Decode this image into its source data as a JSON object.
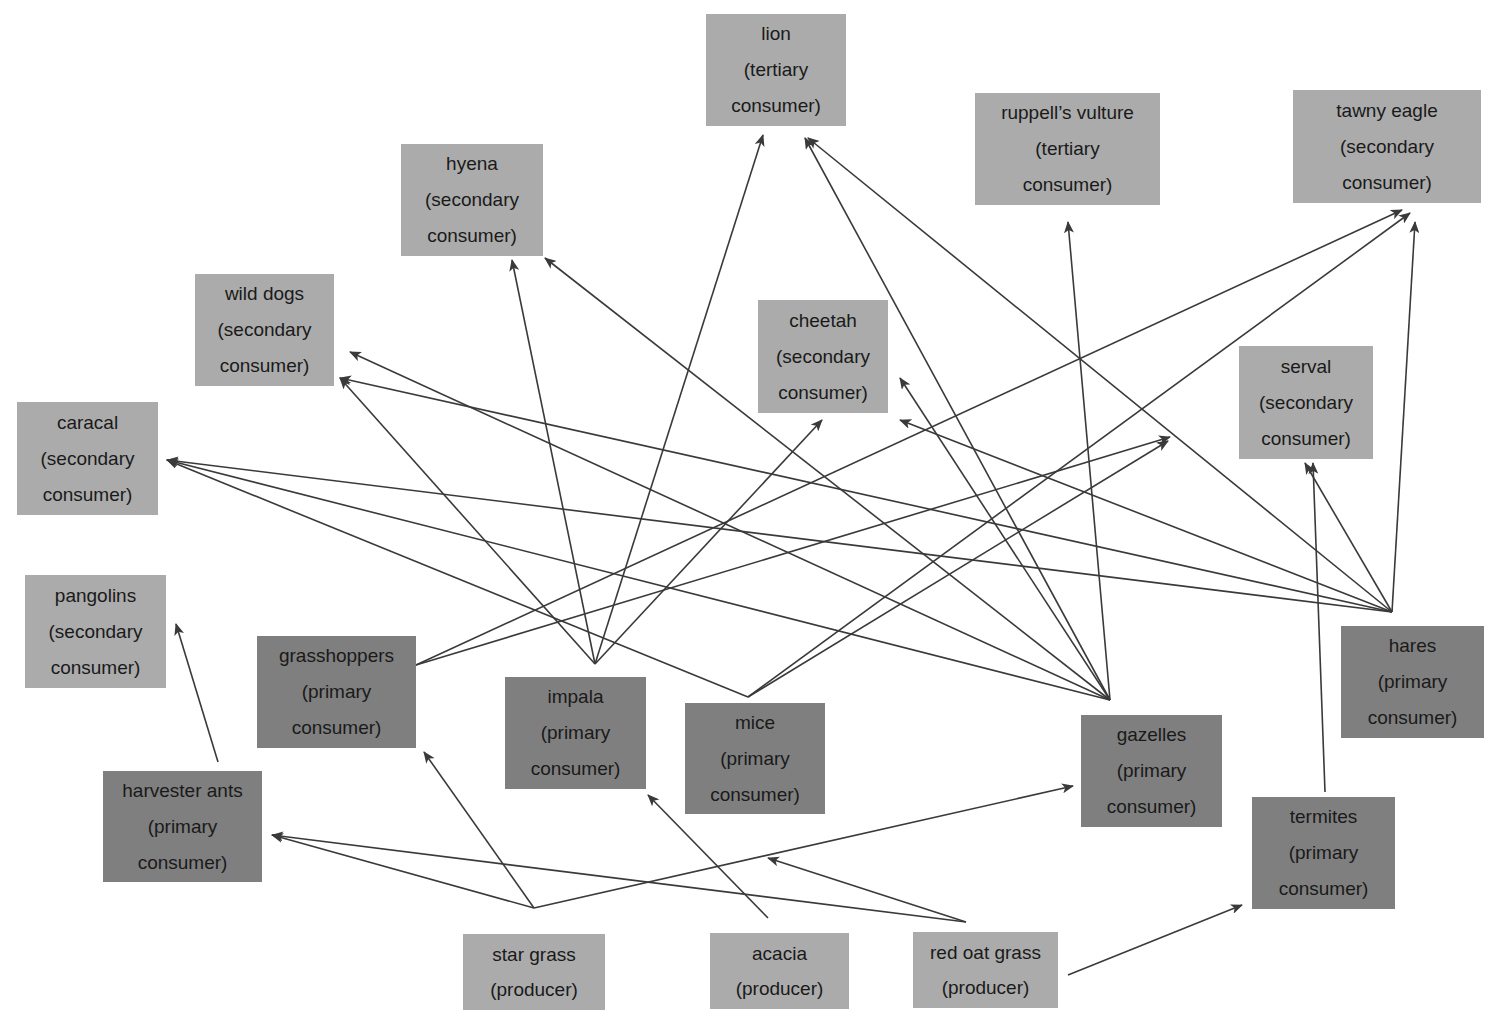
{
  "diagram": {
    "type": "food web",
    "colors": {
      "higher_level_box": "#ababab",
      "primary_consumer_box": "#7f7f7f",
      "producer_box": "#ababab",
      "arrow": "#3a3a3a",
      "text": "#1a1a1a"
    },
    "nodes": [
      {
        "id": "lion",
        "name": "lion",
        "role": "(tertiary",
        "role2": "consumer)",
        "x": 706,
        "y": 14,
        "w": 140,
        "h": 112,
        "tone": "light"
      },
      {
        "id": "hyena",
        "name": "hyena",
        "role": "(secondary",
        "role2": "consumer)",
        "x": 401,
        "y": 144,
        "w": 142,
        "h": 112,
        "tone": "light"
      },
      {
        "id": "ruppells_vulture",
        "name": "ruppell’s vulture",
        "role": "(tertiary",
        "role2": "consumer)",
        "x": 975,
        "y": 93,
        "w": 185,
        "h": 112,
        "tone": "light"
      },
      {
        "id": "tawny_eagle",
        "name": "tawny eagle",
        "role": "(secondary",
        "role2": "consumer)",
        "x": 1293,
        "y": 90,
        "w": 188,
        "h": 113,
        "tone": "light"
      },
      {
        "id": "wild_dogs",
        "name": "wild dogs",
        "role": "(secondary",
        "role2": "consumer)",
        "x": 195,
        "y": 274,
        "w": 139,
        "h": 112,
        "tone": "light"
      },
      {
        "id": "cheetah",
        "name": "cheetah",
        "role": "(secondary",
        "role2": "consumer)",
        "x": 758,
        "y": 300,
        "w": 130,
        "h": 113,
        "tone": "light"
      },
      {
        "id": "caracal",
        "name": "caracal",
        "role": "(secondary",
        "role2": "consumer)",
        "x": 17,
        "y": 402,
        "w": 141,
        "h": 113,
        "tone": "light"
      },
      {
        "id": "serval",
        "name": "serval",
        "role": "(secondary",
        "role2": "consumer)",
        "x": 1239,
        "y": 346,
        "w": 134,
        "h": 113,
        "tone": "light"
      },
      {
        "id": "pangolins",
        "name": "pangolins",
        "role": "(secondary",
        "role2": "consumer)",
        "x": 25,
        "y": 575,
        "w": 141,
        "h": 113,
        "tone": "light"
      },
      {
        "id": "grasshoppers",
        "name": "grasshoppers",
        "role": "(primary",
        "role2": "consumer)",
        "x": 257,
        "y": 636,
        "w": 159,
        "h": 112,
        "tone": "dark"
      },
      {
        "id": "impala",
        "name": "impala",
        "role": "(primary",
        "role2": "consumer)",
        "x": 505,
        "y": 677,
        "w": 141,
        "h": 112,
        "tone": "dark"
      },
      {
        "id": "mice",
        "name": "mice",
        "role": "(primary",
        "role2": "consumer)",
        "x": 685,
        "y": 703,
        "w": 140,
        "h": 111,
        "tone": "dark"
      },
      {
        "id": "hares",
        "name": "hares",
        "role": "(primary",
        "role2": "consumer)",
        "x": 1341,
        "y": 626,
        "w": 143,
        "h": 112,
        "tone": "dark"
      },
      {
        "id": "gazelles",
        "name": "gazelles",
        "role": "(primary",
        "role2": "consumer)",
        "x": 1081,
        "y": 715,
        "w": 141,
        "h": 112,
        "tone": "dark"
      },
      {
        "id": "harvester_ants",
        "name": "harvester ants",
        "role": "(primary",
        "role2": "consumer)",
        "x": 103,
        "y": 771,
        "w": 159,
        "h": 111,
        "tone": "dark"
      },
      {
        "id": "termites",
        "name": "termites",
        "role": "(primary",
        "role2": "consumer)",
        "x": 1252,
        "y": 797,
        "w": 143,
        "h": 112,
        "tone": "dark"
      },
      {
        "id": "star_grass",
        "name": "star grass",
        "role": "(producer)",
        "role2": "",
        "x": 463,
        "y": 934,
        "w": 142,
        "h": 76,
        "tone": "light"
      },
      {
        "id": "acacia",
        "name": "acacia",
        "role": "(producer)",
        "role2": "",
        "x": 710,
        "y": 933,
        "w": 139,
        "h": 76,
        "tone": "light"
      },
      {
        "id": "red_oat_grass",
        "name": "red oat grass",
        "role": "(producer)",
        "role2": "",
        "x": 913,
        "y": 932,
        "w": 145,
        "h": 76,
        "tone": "light"
      }
    ],
    "edges": [
      {
        "from": "harvester_ants",
        "to": "pangolins",
        "x1": 218,
        "y1": 762,
        "x2": 176,
        "y2": 624
      },
      {
        "from": "grasshoppers",
        "to": "tawny_eagle",
        "x1": 416,
        "y1": 665,
        "x2": 1402,
        "y2": 210
      },
      {
        "from": "grasshoppers",
        "to": "serval",
        "x1": 416,
        "y1": 665,
        "x2": 1170,
        "y2": 437
      },
      {
        "from": "impala",
        "to": "wild_dogs",
        "x1": 595,
        "y1": 664,
        "x2": 340,
        "y2": 378
      },
      {
        "from": "impala",
        "to": "hyena",
        "x1": 595,
        "y1": 664,
        "x2": 512,
        "y2": 260
      },
      {
        "from": "impala",
        "to": "lion",
        "x1": 595,
        "y1": 664,
        "x2": 763,
        "y2": 135
      },
      {
        "from": "impala",
        "to": "cheetah",
        "x1": 595,
        "y1": 664,
        "x2": 822,
        "y2": 420
      },
      {
        "from": "mice",
        "to": "caracal",
        "x1": 748,
        "y1": 697,
        "x2": 167,
        "y2": 460
      },
      {
        "from": "mice",
        "to": "tawny_eagle",
        "x1": 748,
        "y1": 697,
        "x2": 1410,
        "y2": 213
      },
      {
        "from": "mice",
        "to": "serval",
        "x1": 748,
        "y1": 697,
        "x2": 1168,
        "y2": 441
      },
      {
        "from": "gazelles",
        "to": "wild_dogs",
        "x1": 1110,
        "y1": 700,
        "x2": 350,
        "y2": 352
      },
      {
        "from": "gazelles",
        "to": "hyena",
        "x1": 1110,
        "y1": 700,
        "x2": 545,
        "y2": 258
      },
      {
        "from": "gazelles",
        "to": "lion",
        "x1": 1110,
        "y1": 700,
        "x2": 805,
        "y2": 138
      },
      {
        "from": "gazelles",
        "to": "cheetah",
        "x1": 1110,
        "y1": 700,
        "x2": 900,
        "y2": 378
      },
      {
        "from": "gazelles",
        "to": "caracal",
        "x1": 1110,
        "y1": 700,
        "x2": 167,
        "y2": 460
      },
      {
        "from": "gazelles",
        "to": "ruppells_vulture",
        "x1": 1110,
        "y1": 700,
        "x2": 1068,
        "y2": 222
      },
      {
        "from": "hares",
        "to": "lion",
        "x1": 1392,
        "y1": 612,
        "x2": 808,
        "y2": 138
      },
      {
        "from": "hares",
        "to": "cheetah",
        "x1": 1392,
        "y1": 612,
        "x2": 900,
        "y2": 420
      },
      {
        "from": "hares",
        "to": "caracal",
        "x1": 1392,
        "y1": 612,
        "x2": 167,
        "y2": 460
      },
      {
        "from": "hares",
        "to": "wild_dogs",
        "x1": 1392,
        "y1": 612,
        "x2": 340,
        "y2": 378
      },
      {
        "from": "hares",
        "to": "serval",
        "x1": 1392,
        "y1": 612,
        "x2": 1305,
        "y2": 463
      },
      {
        "from": "hares",
        "to": "tawny_eagle",
        "x1": 1392,
        "y1": 612,
        "x2": 1415,
        "y2": 222
      },
      {
        "from": "termites",
        "to": "serval",
        "x1": 1325,
        "y1": 792,
        "x2": 1313,
        "y2": 463
      },
      {
        "from": "star_grass",
        "to": "harvester_ants",
        "x1": 534,
        "y1": 908,
        "x2": 272,
        "y2": 835
      },
      {
        "from": "star_grass",
        "to": "grasshoppers",
        "x1": 534,
        "y1": 908,
        "x2": 424,
        "y2": 752
      },
      {
        "from": "star_grass",
        "to": "gazelles",
        "x1": 534,
        "y1": 908,
        "x2": 1073,
        "y2": 786
      },
      {
        "from": "acacia",
        "to": "impala",
        "x1": 768,
        "y1": 918,
        "x2": 648,
        "y2": 795
      },
      {
        "from": "red_oat_grass",
        "to": "harvester_ants",
        "x1": 966,
        "y1": 922,
        "x2": 272,
        "y2": 835
      },
      {
        "from": "red_oat_grass",
        "to": "mice",
        "x1": 966,
        "y1": 922,
        "x2": 768,
        "y2": 858
      },
      {
        "from": "red_oat_grass",
        "to": "termites",
        "x1": 1068,
        "y1": 975,
        "x2": 1242,
        "y2": 905
      }
    ]
  }
}
